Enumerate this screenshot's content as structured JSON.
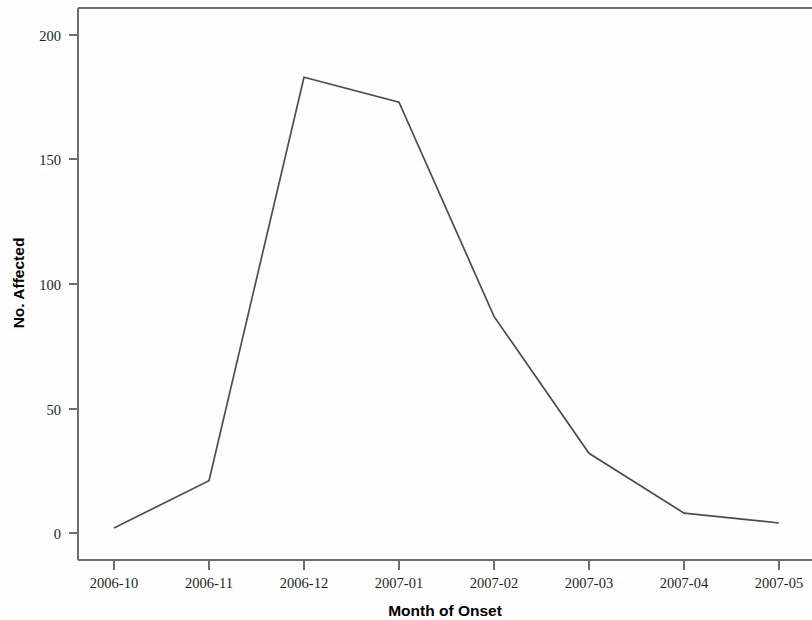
{
  "chart_data": {
    "type": "line",
    "title": "",
    "xlabel": "Month of Onset",
    "ylabel": "No. Affected",
    "categories": [
      "2006-10",
      "2006-11",
      "2006-12",
      "2007-01",
      "2007-02",
      "2007-03",
      "2007-04",
      "2007-05"
    ],
    "values": [
      2,
      21,
      183,
      173,
      87,
      32,
      8,
      4
    ],
    "series": [
      {
        "name": "No. Affected",
        "values": [
          2,
          21,
          183,
          173,
          87,
          32,
          8,
          4
        ]
      }
    ],
    "ylim": [
      0,
      210
    ],
    "ytick_labels": [
      "0",
      "50",
      "100",
      "150",
      "200"
    ],
    "ytick_values": [
      0,
      50,
      100,
      150,
      200
    ],
    "xtick_labels": [
      "2006-10",
      "2006-11",
      "2006-12",
      "2007-01",
      "2007-02",
      "2007-03",
      "2007-04",
      "2007-05"
    ],
    "grid": false,
    "legend": false,
    "legend_position": "none",
    "line_color": "#4d4d4d",
    "axis_color": "#6e6e6e",
    "background_color": "#ffffff"
  },
  "axes": {
    "x_title": "Month of Onset",
    "y_title": "No. Affected"
  },
  "y_ticks": [
    {
      "label": "200",
      "value": 200
    },
    {
      "label": "150",
      "value": 150
    },
    {
      "label": "100",
      "value": 100
    },
    {
      "label": "50",
      "value": 50
    },
    {
      "label": "0",
      "value": 0
    }
  ],
  "x_ticks": [
    {
      "label": "2006-10",
      "value": 2
    },
    {
      "label": "2006-11",
      "value": 21
    },
    {
      "label": "2006-12",
      "value": 183
    },
    {
      "label": "2007-01",
      "value": 173
    },
    {
      "label": "2007-02",
      "value": 87
    },
    {
      "label": "2007-03",
      "value": 32
    },
    {
      "label": "2007-04",
      "value": 8
    },
    {
      "label": "2007-05",
      "value": 4
    }
  ]
}
